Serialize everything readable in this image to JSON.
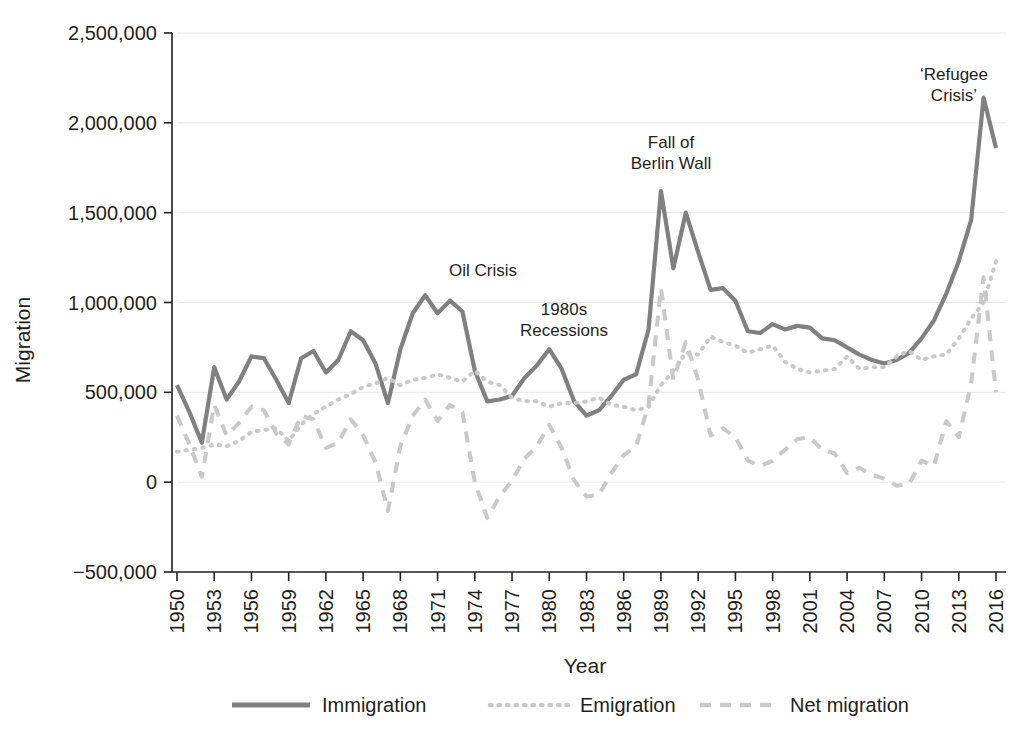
{
  "chart_data": {
    "type": "line",
    "title": "",
    "xlabel": "Year",
    "ylabel": "Migration",
    "xlim": [
      1950,
      2016
    ],
    "ylim": [
      -500000,
      2500000
    ],
    "grid": true,
    "legend_position": "bottom",
    "x_tick_labels": [
      "1950",
      "1953",
      "1956",
      "1959",
      "1962",
      "1965",
      "1968",
      "1971",
      "1974",
      "1977",
      "1980",
      "1983",
      "1986",
      "1989",
      "1992",
      "1995",
      "1998",
      "2001",
      "2004",
      "2007",
      "2010",
      "2013",
      "2016"
    ],
    "y_tick_labels": [
      "2,500,000",
      "2,000,000",
      "1,500,000",
      "1,000,000",
      "500,000",
      "0",
      "−500,000"
    ],
    "y_tick_values": [
      2500000,
      2000000,
      1500000,
      1000000,
      500000,
      0,
      -500000
    ],
    "x": [
      1950,
      1951,
      1952,
      1953,
      1954,
      1955,
      1956,
      1957,
      1958,
      1959,
      1960,
      1961,
      1962,
      1963,
      1964,
      1965,
      1966,
      1967,
      1968,
      1969,
      1970,
      1971,
      1972,
      1973,
      1974,
      1975,
      1976,
      1977,
      1978,
      1979,
      1980,
      1981,
      1982,
      1983,
      1984,
      1985,
      1986,
      1987,
      1988,
      1989,
      1990,
      1991,
      1992,
      1993,
      1994,
      1995,
      1996,
      1997,
      1998,
      1999,
      2000,
      2001,
      2002,
      2003,
      2004,
      2005,
      2006,
      2007,
      2008,
      2009,
      2010,
      2011,
      2012,
      2013,
      2014,
      2015,
      2016
    ],
    "series": [
      {
        "name": "Immigration",
        "style": "solid",
        "color": "#808080",
        "values": [
          540000,
          390000,
          220000,
          640000,
          460000,
          560000,
          700000,
          690000,
          570000,
          440000,
          690000,
          730000,
          610000,
          680000,
          840000,
          790000,
          660000,
          440000,
          740000,
          940000,
          1040000,
          940000,
          1010000,
          950000,
          620000,
          450000,
          460000,
          480000,
          580000,
          650000,
          740000,
          630000,
          450000,
          370000,
          400000,
          480000,
          570000,
          600000,
          850000,
          1620000,
          1190000,
          1500000,
          1280000,
          1070000,
          1080000,
          1010000,
          840000,
          830000,
          880000,
          850000,
          870000,
          860000,
          800000,
          790000,
          750000,
          710000,
          680000,
          660000,
          680000,
          720000,
          800000,
          900000,
          1050000,
          1230000,
          1460000,
          2140000,
          1860000
        ]
      },
      {
        "name": "Emigration",
        "style": "dotted",
        "color": "#c9c9c9",
        "values": [
          170000,
          180000,
          190000,
          210000,
          200000,
          230000,
          280000,
          290000,
          300000,
          230000,
          320000,
          380000,
          420000,
          460000,
          490000,
          530000,
          550000,
          580000,
          540000,
          570000,
          580000,
          600000,
          580000,
          560000,
          620000,
          560000,
          540000,
          470000,
          450000,
          450000,
          420000,
          440000,
          440000,
          450000,
          470000,
          430000,
          420000,
          400000,
          420000,
          540000,
          620000,
          720000,
          710000,
          810000,
          780000,
          760000,
          720000,
          740000,
          760000,
          670000,
          630000,
          610000,
          620000,
          630000,
          700000,
          630000,
          640000,
          640000,
          700000,
          730000,
          680000,
          700000,
          710000,
          800000,
          910000,
          1000000,
          1230000
        ]
      },
      {
        "name": "Net migration",
        "style": "dashed",
        "color": "#c9c9c9",
        "values": [
          370000,
          210000,
          30000,
          430000,
          260000,
          330000,
          420000,
          400000,
          270000,
          210000,
          370000,
          350000,
          190000,
          220000,
          350000,
          260000,
          110000,
          -160000,
          200000,
          370000,
          460000,
          340000,
          430000,
          390000,
          0,
          -200000,
          -80000,
          10000,
          130000,
          200000,
          320000,
          190000,
          10000,
          -80000,
          -70000,
          50000,
          150000,
          200000,
          430000,
          1080000,
          570000,
          780000,
          570000,
          260000,
          300000,
          250000,
          120000,
          90000,
          120000,
          180000,
          240000,
          250000,
          180000,
          160000,
          50000,
          80000,
          40000,
          20000,
          -20000,
          -10000,
          120000,
          90000,
          340000,
          250000,
          550000,
          1140000,
          500000
        ]
      }
    ],
    "annotations": [
      {
        "id": "oil-crisis",
        "lines": [
          "Oil Crisis"
        ],
        "x": 483,
        "y": 276
      },
      {
        "id": "recessions-1980s",
        "lines": [
          "1980s",
          "Recessions"
        ],
        "x": 564,
        "y": 315
      },
      {
        "id": "fall-of-berlin-wall",
        "lines": [
          "Fall of",
          "Berlin Wall"
        ],
        "x": 671,
        "y": 148
      },
      {
        "id": "refugee-crisis",
        "lines": [
          "‘Refugee",
          "Crisis’"
        ],
        "x": 954,
        "y": 80
      }
    ]
  },
  "legend": {
    "items": [
      {
        "label": "Immigration",
        "style": "solid",
        "color": "#808080"
      },
      {
        "label": "Emigration",
        "style": "dotted",
        "color": "#c9c9c9"
      },
      {
        "label": "Net migration",
        "style": "dashed",
        "color": "#c9c9c9"
      }
    ]
  }
}
